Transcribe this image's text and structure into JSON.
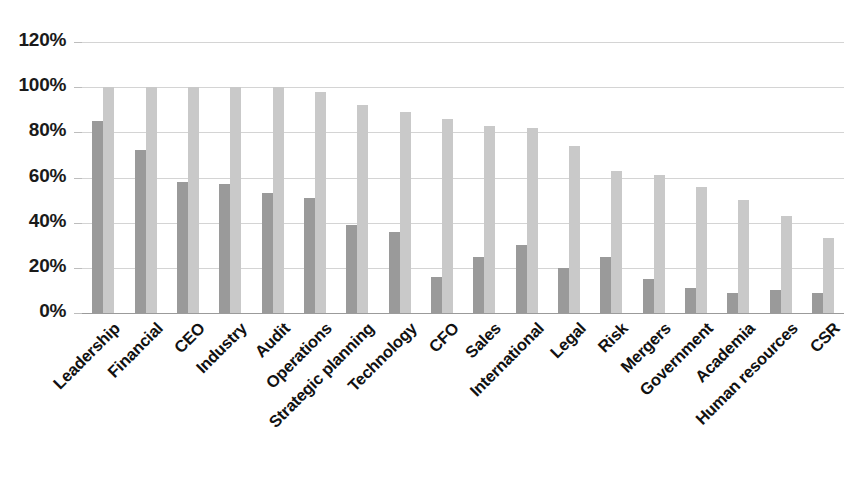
{
  "chart_data": {
    "type": "bar",
    "title": "",
    "subtitle": "",
    "xlabel": "",
    "ylabel": "",
    "ylim": [
      0,
      120
    ],
    "ytick_labels": [
      "120%",
      "100%",
      "80%",
      "60%",
      "40%",
      "20%",
      "0%"
    ],
    "ytick_values": [
      120,
      100,
      80,
      60,
      40,
      20,
      0
    ],
    "grid": true,
    "legend": "none",
    "orientation": "vertical",
    "grouping": "grouped",
    "categories": [
      "Leadership",
      "Financial",
      "CEO",
      "Industry",
      "Audit",
      "Operations",
      "Strategic planning",
      "Technology",
      "CFO",
      "Sales",
      "International",
      "Legal",
      "Risk",
      "Mergers",
      "Government",
      "Academia",
      "Human resources",
      "CSR"
    ],
    "series": [
      {
        "name": "series-a",
        "color": "#9a9a9a",
        "values": [
          85,
          72,
          58,
          57,
          53,
          51,
          39,
          36,
          16,
          25,
          30,
          20,
          25,
          15,
          11,
          9,
          10,
          9
        ]
      },
      {
        "name": "series-b",
        "color": "#c9c9c9",
        "values": [
          100,
          100,
          100,
          100,
          100,
          98,
          92,
          89,
          86,
          83,
          82,
          74,
          63,
          61,
          56,
          50,
          43,
          33
        ]
      }
    ]
  },
  "colors": {
    "series_a": "#9a9a9a",
    "series_b": "#c9c9c9",
    "gridline": "#d4d4d4",
    "axis": "#9b9b9b",
    "text": "#111111",
    "background": "#ffffff"
  }
}
